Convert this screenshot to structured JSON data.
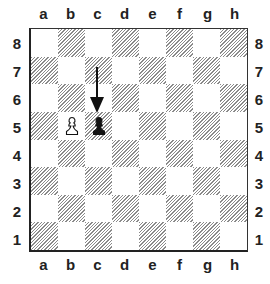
{
  "diagram": {
    "files": [
      "a",
      "b",
      "c",
      "d",
      "e",
      "f",
      "g",
      "h"
    ],
    "ranks": [
      "8",
      "7",
      "6",
      "5",
      "4",
      "3",
      "2",
      "1"
    ],
    "light_square_color": "#ffffff",
    "dark_square_style": "diagonal-hatched gray",
    "pieces": [
      {
        "square": "b5",
        "piece": "pawn",
        "color": "white",
        "icon": "white-pawn-icon"
      },
      {
        "square": "c5",
        "piece": "pawn",
        "color": "black",
        "icon": "black-pawn-icon"
      }
    ],
    "arrows": [
      {
        "from": "c7",
        "to": "c5",
        "color": "#111111",
        "meaning": "black pawn move c7-c5 (two-square advance)"
      }
    ]
  }
}
